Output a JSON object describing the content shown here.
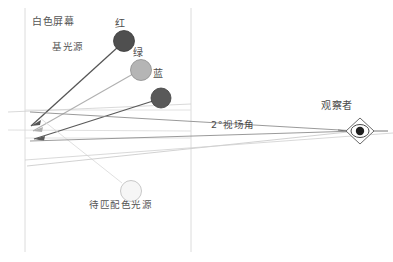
{
  "diagram": {
    "title_text": "视觉颜色匹配实验示意图",
    "type": "optical-ray-diagram",
    "canvas": {
      "width": 393,
      "height": 262,
      "background": "#ffffff"
    },
    "labels": {
      "screen": "白色屏幕",
      "base_source": "基光源",
      "red": "红",
      "green": "绿",
      "blue": "蓝",
      "field_of_view": "2°视场角",
      "observer": "观察者",
      "test_source": "待匹配色光源"
    },
    "sources": [
      {
        "name": "red-source",
        "label": "红",
        "cx": 124,
        "cy": 41,
        "r": 10.5,
        "fill": "#4f4f4f",
        "stroke": "#3a3a3a"
      },
      {
        "name": "green-source",
        "label": "绿",
        "cx": 141,
        "cy": 70,
        "r": 10.5,
        "fill": "#b5b5b5",
        "stroke": "#8d8d8d"
      },
      {
        "name": "blue-source",
        "label": "蓝",
        "cx": 161,
        "cy": 98,
        "r": 10.0,
        "fill": "#595959",
        "stroke": "#3f3f3f"
      },
      {
        "name": "test-source",
        "label": "待匹配色光源",
        "cx": 131,
        "cy": 191,
        "r": 10.5,
        "fill": "#f4f4f4",
        "stroke": "#bdbdbd"
      }
    ],
    "screen": {
      "left_edge_x": 25,
      "right_edge_x": 191,
      "top_y": 8,
      "bottom_y": 252,
      "split_upper_y": 110,
      "split_lower_y": 138,
      "stroke": "#d8d8d8"
    },
    "observer": {
      "eye_cx": 360,
      "eye_cy": 131,
      "pupil_fill": "#1f1f1f",
      "outline_stroke": "#5a5a5a"
    },
    "rays": {
      "converge_upper": {
        "x": 31,
        "y": 123
      },
      "converge_lower": {
        "x": 33,
        "y": 131
      },
      "stroke_dark": "#555555",
      "stroke_light": "#a9a9a9",
      "stroke_faint": "#cfcfcf"
    },
    "colors": {
      "ink": "#4a4a4a",
      "line_dark": "#555555",
      "line_mid": "#9a9a9a",
      "line_faint": "#d5d5d5",
      "background": "#ffffff"
    }
  }
}
